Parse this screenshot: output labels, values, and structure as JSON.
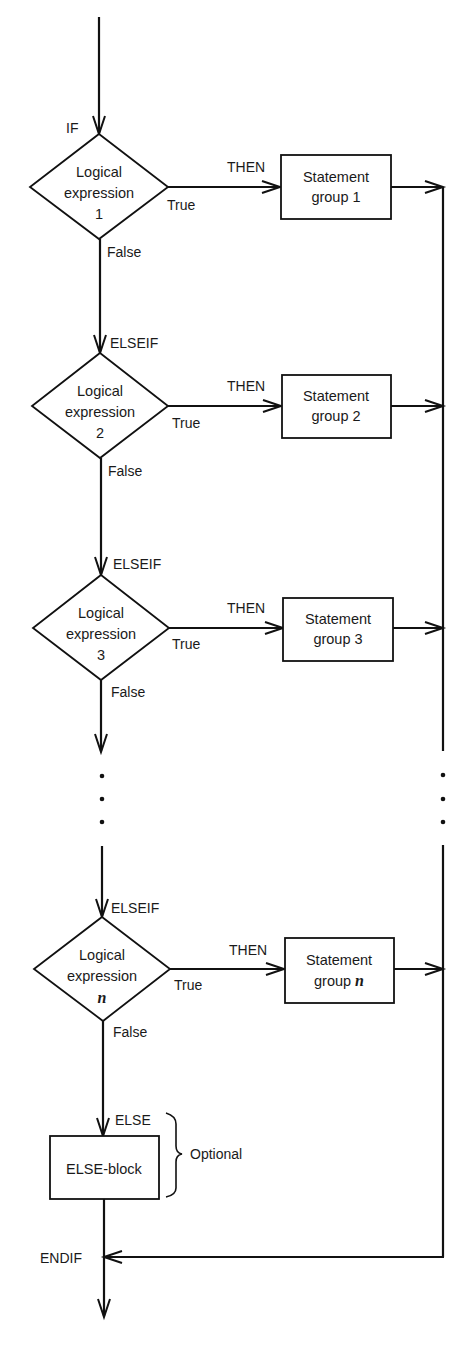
{
  "diagram": {
    "type": "flowchart",
    "title": "",
    "entry_label": "IF",
    "branch_keyword": "ELSEIF",
    "then_label": "THEN",
    "true_label": "True",
    "false_label": "False",
    "conditions": [
      {
        "line1": "Logical",
        "line2": "expression",
        "index": "1",
        "keyword": "IF",
        "statement_line1": "Statement",
        "statement_line2": "group 1"
      },
      {
        "line1": "Logical",
        "line2": "expression",
        "index": "2",
        "keyword": "ELSEIF",
        "statement_line1": "Statement",
        "statement_line2": "group 2"
      },
      {
        "line1": "Logical",
        "line2": "expression",
        "index": "3",
        "keyword": "ELSEIF",
        "statement_line1": "Statement",
        "statement_line2": "group 3"
      },
      {
        "line1": "Logical",
        "line2": "expression",
        "index": "n",
        "keyword": "ELSEIF",
        "statement_line1": "Statement",
        "statement_line2": "group",
        "statement_index": "n"
      }
    ],
    "else": {
      "keyword": "ELSE",
      "block_label": "ELSE-block",
      "brace_label": "Optional"
    },
    "end_label": "ENDIF",
    "ellipsis": "⋮"
  }
}
